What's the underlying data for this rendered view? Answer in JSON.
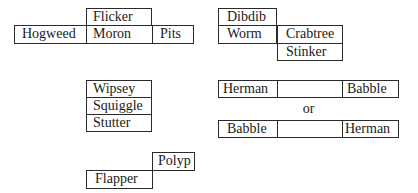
{
  "diagrams": {
    "group1": {
      "top": "Flicker",
      "left": "Hogweed",
      "middle": "Moron",
      "right": "Pits"
    },
    "group2": {
      "top_left": "Dibdib",
      "bottom_left": "Worm",
      "top_right": "Crabtree",
      "bottom_right": "Stinker"
    },
    "group3": {
      "rows": [
        "Wipsey",
        "Squiggle",
        "Stutter"
      ]
    },
    "group4": {
      "row1": {
        "left": "Herman",
        "middle": "",
        "right": "Babble"
      },
      "separator": "or",
      "row2": {
        "left": "Babble",
        "middle": "",
        "right": "Herman"
      }
    },
    "group5": {
      "top_right": "Polyp",
      "bottom_left": "Flapper"
    }
  }
}
